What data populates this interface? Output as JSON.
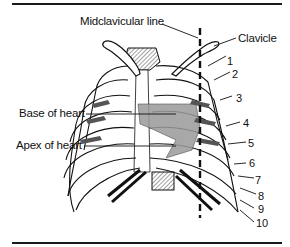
{
  "figure": {
    "type": "anatomical-diagram",
    "labels": {
      "midclavicular_line": "Midclavicular line",
      "clavicle": "Clavicle",
      "base_of_heart": "Base of heart",
      "apex_of_heart": "Apex of heart"
    },
    "rib_numbers": [
      "1",
      "2",
      "3",
      "4",
      "5",
      "6",
      "7",
      "8",
      "9",
      "10"
    ],
    "colors": {
      "line": "#111111",
      "heart_fill": "#9a9a9a",
      "hatch": "#555555",
      "background": "#ffffff"
    }
  }
}
